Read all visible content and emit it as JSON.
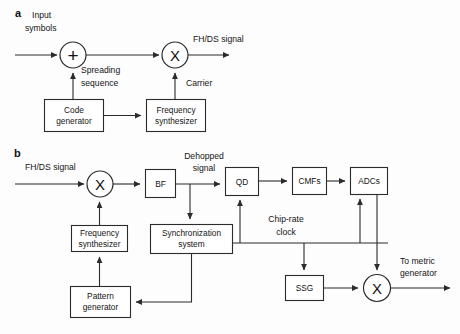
{
  "figure": {
    "background_color": "#fdfdfd",
    "line_color": "#2b2b2b",
    "text_color": "#141414"
  },
  "panel_a": {
    "letter": "a",
    "labels": {
      "input_line1": "Input",
      "input_line2": "symbols",
      "output": "FH/DS signal",
      "spreading_line1": "Spreading",
      "spreading_line2": "sequence",
      "carrier": "Carrier"
    },
    "operators": {
      "adder": "+",
      "mixer": "X"
    },
    "blocks": [
      {
        "id": "code-generator",
        "line1": "Code",
        "line2": "generator"
      },
      {
        "id": "frequency-synthesizer",
        "line1": "Frequency",
        "line2": "synthesizer"
      }
    ]
  },
  "panel_b": {
    "letter": "b",
    "labels": {
      "input": "FH/DS signal",
      "dehopped_line1": "Dehopped",
      "dehopped_line2": "signal",
      "chip_rate_line1": "Chip-rate",
      "chip_rate_line2": "clock",
      "output_line1": "To metric",
      "output_line2": "generator"
    },
    "operators": {
      "front_mixer": "X",
      "output_mixer": "X"
    },
    "blocks": [
      {
        "id": "bf",
        "line1": "BF",
        "line2": ""
      },
      {
        "id": "qd",
        "line1": "QD",
        "line2": ""
      },
      {
        "id": "cmfs",
        "line1": "CMFs",
        "line2": ""
      },
      {
        "id": "adcs",
        "line1": "ADCs",
        "line2": ""
      },
      {
        "id": "ssg",
        "line1": "SSG",
        "line2": ""
      },
      {
        "id": "frequency-synthesizer",
        "line1": "Frequency",
        "line2": "synthesizer"
      },
      {
        "id": "synchronization-system",
        "line1": "Synchronization",
        "line2": "system"
      },
      {
        "id": "pattern-generator",
        "line1": "Pattern",
        "line2": "generator"
      }
    ]
  }
}
